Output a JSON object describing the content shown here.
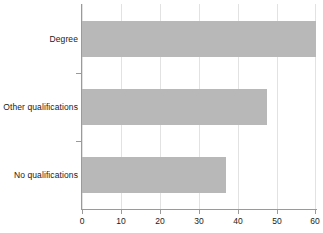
{
  "chart_data": {
    "type": "bar",
    "orientation": "horizontal",
    "title": "",
    "subtitle": "",
    "xlabel": "",
    "ylabel": "",
    "categories": [
      "Degree",
      "Other qualifications",
      "No qualifications"
    ],
    "values": [
      60,
      47.5,
      37
    ],
    "series": [
      {
        "name": "",
        "values": [
          60,
          47.5,
          37
        ]
      }
    ],
    "xlim": [
      0,
      60
    ],
    "xticks": [
      0,
      10,
      20,
      30,
      40,
      50,
      60
    ],
    "xtick_labels": [
      "0",
      "10",
      "20",
      "30",
      "40",
      "50",
      "60"
    ],
    "grid": true,
    "grid_axis": "x",
    "legend": false,
    "legend_position": "none",
    "annotations": [],
    "bar_color": "#b8b8b8",
    "axis_color": "#9a9a9a",
    "gridline_color": "#e2e2e2",
    "text_color": "#1a1a1a",
    "background_color": "#ffffff"
  }
}
